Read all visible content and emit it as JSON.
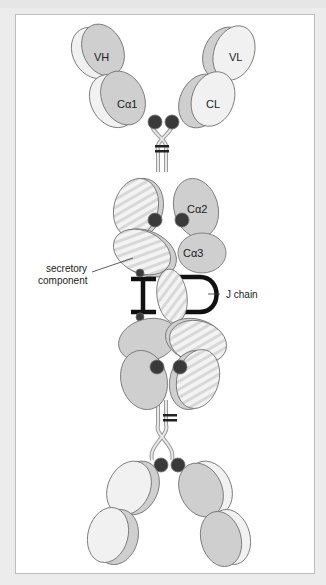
{
  "figure": {
    "labels": {
      "vh": "VH",
      "vl": "VL",
      "ca1": "Cα1",
      "cl": "CL",
      "ca2": "Cα2",
      "ca3": "Cα3",
      "secretory_component_1": "secretory",
      "secretory_component_2": "component",
      "j_chain": "J chain"
    },
    "colors": {
      "heavy_chain": "#cfcfcf",
      "light_chain": "#f1f1f1",
      "disulfide_dot": "#3a3a3a",
      "j_chain": "#111111",
      "outline": "#6e6e6e"
    }
  }
}
